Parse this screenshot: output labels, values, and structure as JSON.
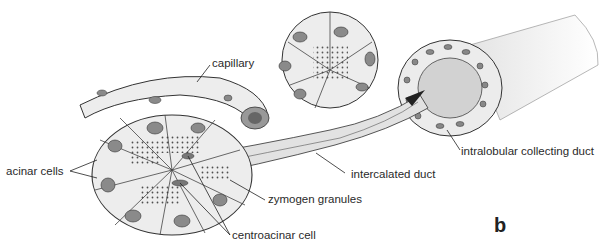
{
  "figure": {
    "panel_letter": "b",
    "labels": {
      "capillary": "capillary",
      "acinar_cells": "acinar cells",
      "zymogen_granules": "zymogen granules",
      "centroacinar_cell": "centroacinar cell",
      "intercalated_duct": "intercalated duct",
      "intralobular_collecting_duct": "intralobular collecting duct"
    },
    "colors": {
      "cell_fill": "#ededed",
      "nucleus_fill": "#8a8a8a",
      "outline": "#333333",
      "lumen_fill": "#d0d0d0"
    }
  }
}
